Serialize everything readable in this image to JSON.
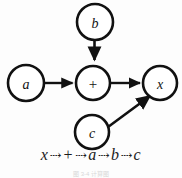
{
  "figure": {
    "type": "dataflow-graph",
    "background_color": "#fdfdfd",
    "stroke_color": "#111111",
    "nodes": [
      {
        "id": "b",
        "label": "b",
        "cx": 95,
        "cy": 22,
        "r": 18,
        "style": "italic"
      },
      {
        "id": "a",
        "label": "a",
        "cx": 26,
        "cy": 83,
        "r": 18,
        "style": "italic"
      },
      {
        "id": "plus",
        "label": "+",
        "cx": 93,
        "cy": 83,
        "r": 17,
        "style": "upright"
      },
      {
        "id": "x",
        "label": "x",
        "cx": 160,
        "cy": 83,
        "r": 17,
        "style": "italic"
      },
      {
        "id": "c",
        "label": "c",
        "cx": 92,
        "cy": 132,
        "r": 17,
        "style": "italic"
      }
    ],
    "edges": [
      {
        "from": "b",
        "to": "plus",
        "direction": "down"
      },
      {
        "from": "a",
        "to": "plus",
        "direction": "right"
      },
      {
        "from": "plus",
        "to": "x",
        "direction": "right"
      },
      {
        "from": "c",
        "to": "x",
        "direction": "diagonal-up-right"
      }
    ]
  },
  "sequence": {
    "arrow_glyph": "⇢",
    "items": [
      "x",
      "+",
      "a",
      "b",
      "c"
    ],
    "full_text": "x ⇢ + ⇢ a ⇢ b ⇢ c"
  },
  "caption": {
    "text": "图 3-4  计算图"
  }
}
